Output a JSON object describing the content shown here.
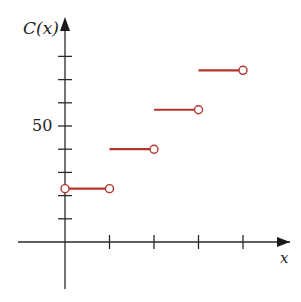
{
  "chart_data": {
    "type": "line",
    "subtype": "step",
    "title": "",
    "xlabel": "x",
    "ylabel": "C(x)",
    "x_ticks": [
      0,
      1,
      2,
      3,
      4
    ],
    "x_tick_labels": [],
    "y_ticks": [
      10,
      20,
      30,
      40,
      50,
      60,
      70,
      80
    ],
    "y_tick_labels": [
      {
        "value": 50,
        "label": "50"
      }
    ],
    "xlim": [
      -1.05,
      5.1
    ],
    "ylim": [
      -20,
      96
    ],
    "grid": false,
    "legend": null,
    "series": [
      {
        "name": "C(x)",
        "color": "#b5342e",
        "segments": [
          {
            "x_start": 0,
            "x_end": 1,
            "y": 23,
            "left": "open",
            "right": "open"
          },
          {
            "x_start": 1,
            "x_end": 2,
            "y": 40,
            "left": "closed",
            "right": "open"
          },
          {
            "x_start": 2,
            "x_end": 3,
            "y": 57,
            "left": "closed",
            "right": "open"
          },
          {
            "x_start": 3,
            "x_end": 4,
            "y": 74,
            "left": "closed",
            "right": "open"
          }
        ]
      }
    ]
  },
  "labels": {
    "y_axis": "C(x)",
    "x_axis": "x",
    "y_tick_50": "50"
  },
  "colors": {
    "axis": "#2a2a2a",
    "step": "#b5342e"
  }
}
